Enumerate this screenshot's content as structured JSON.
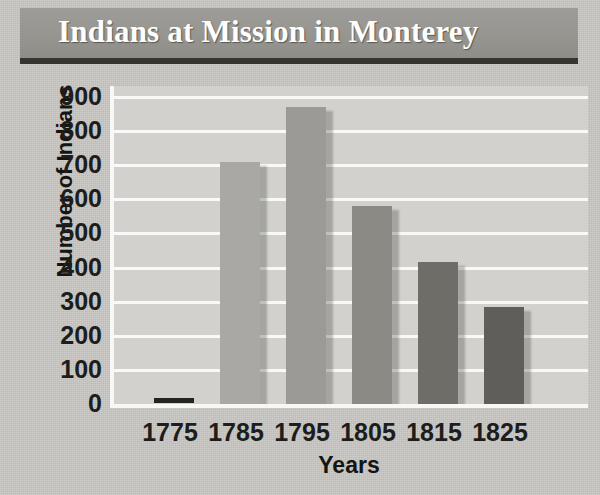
{
  "title": "Indians at Mission in Monterey",
  "chart_data": {
    "type": "bar",
    "title": "Indians at Mission in Monterey",
    "xlabel": "Years",
    "ylabel": "Number of Indians",
    "categories": [
      "1775",
      "1785",
      "1795",
      "1805",
      "1815",
      "1825"
    ],
    "values": [
      0,
      710,
      870,
      580,
      415,
      285
    ],
    "ylim": [
      0,
      900
    ],
    "yticks": [
      0,
      100,
      200,
      300,
      400,
      500,
      600,
      700,
      800,
      900
    ],
    "ytick_labels": [
      "0",
      "100",
      "200",
      "300",
      "400",
      "500",
      "600",
      "700",
      "800",
      "900"
    ],
    "grid": true,
    "grid_color": "#f9f9f7",
    "legend": null,
    "bar_colors": [
      "#232320",
      "#a9a8a4",
      "#9b9a96",
      "#8b8a85",
      "#6e6d68",
      "#5f5e5a"
    ],
    "plot_background": "#d2d1cd",
    "page_background": "#c9c8c4",
    "title_banner_color": "#96958f",
    "title_text_color": "#fdfdfb"
  }
}
